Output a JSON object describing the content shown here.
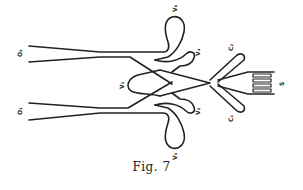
{
  "figure": {
    "caption": "Fig. 7",
    "labels": {
      "o2": "O₂",
      "o1": "O₁",
      "v6": "V₆",
      "v4": "V₄",
      "v1": "V₁",
      "v3": "V₃",
      "v2": "V₂",
      "v5": "V₅",
      "c2": "C₂",
      "c1": "C₁",
      "s": "S"
    },
    "stroke_color": "#222222",
    "background": "#ffffff"
  }
}
